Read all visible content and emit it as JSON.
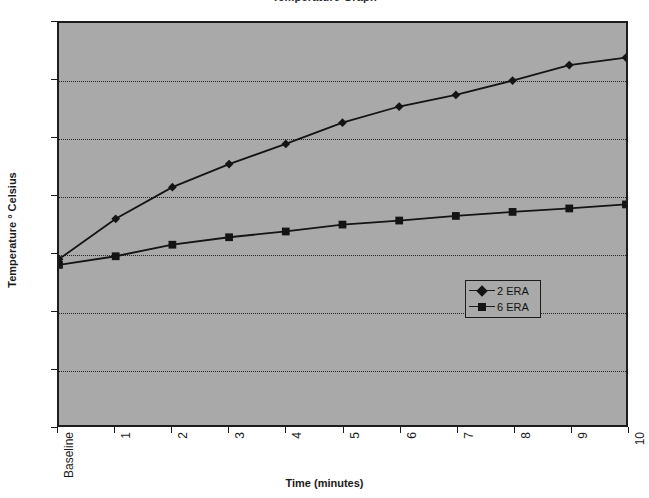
{
  "chart_data": {
    "type": "line",
    "title": "Temperature Graph",
    "xlabel": "Time (minutes)",
    "ylabel": "Temperature ° Celsius",
    "categories": [
      "Baseline",
      "1",
      "2",
      "3",
      "4",
      "5",
      "6",
      "7",
      "8",
      "9",
      "10"
    ],
    "ylim": [
      33,
      40
    ],
    "yticks": [
      33,
      34,
      35,
      36,
      37,
      38,
      39,
      40
    ],
    "grid": true,
    "legend_position": "center-right",
    "plot_background": "#a9a9a9",
    "series": [
      {
        "name": "2 ERA",
        "marker": "diamond",
        "color": "#141414",
        "values": [
          35.9,
          36.6,
          37.15,
          37.55,
          37.9,
          38.27,
          38.55,
          38.75,
          39.0,
          39.27,
          39.4
        ]
      },
      {
        "name": "6 ERA",
        "marker": "square",
        "color": "#141414",
        "values": [
          35.8,
          35.95,
          36.15,
          36.28,
          36.38,
          36.5,
          36.57,
          36.65,
          36.72,
          36.78,
          36.85
        ]
      }
    ]
  },
  "legend": {
    "items": [
      {
        "label": "2 ERA",
        "marker": "diamond"
      },
      {
        "label": "6 ERA",
        "marker": "square"
      }
    ]
  }
}
